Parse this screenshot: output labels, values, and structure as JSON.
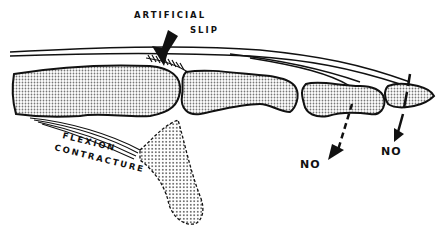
{
  "figure": {
    "colors": {
      "ink": "#111111",
      "bone_fill": "#c8c8c8",
      "background": "#ffffff"
    },
    "labels": {
      "artificial_slip_line1": "ARTIFICIAL",
      "artificial_slip_line2": "SLIP",
      "flexion_line1": "FLEXION",
      "flexion_line2": "CONTRACTURE",
      "no_left": "NO",
      "no_right": "NO"
    }
  }
}
